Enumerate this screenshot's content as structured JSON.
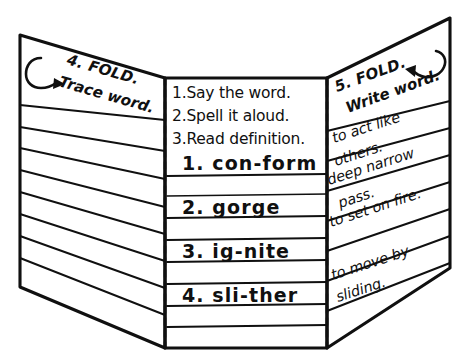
{
  "diagram": {
    "type": "hand-drawn-trifold",
    "ink_color": "#101010",
    "paper_color": "#ffffff",
    "panels": [
      {
        "id": "left",
        "name": "trace-panel",
        "heading_number": "4. FOLD.",
        "heading_text": "Trace word.",
        "arrow_icon": "curved-arrow-right",
        "ruled_line_count": 9,
        "entries": []
      },
      {
        "id": "middle",
        "name": "steps-and-words-panel",
        "steps": [
          "1.Say the word.",
          "2.Spell it aloud.",
          "3.Read definition."
        ],
        "words": [
          "1. con-form",
          "2. gorge",
          "3. ig-nite",
          "4. sli-ther"
        ],
        "ruled_line_count": 10
      },
      {
        "id": "right",
        "name": "write-and-define-panel",
        "heading_number": "5. FOLD.",
        "heading_text": "Write word.",
        "arrow_icon": "curved-arrow-left",
        "definitions": [
          {
            "line1": "to act like",
            "line2": "others."
          },
          {
            "line1": "deep narrow",
            "line2": "pass."
          },
          {
            "line1": "to set on fire.",
            "line2": ""
          },
          {
            "line1": "to move by",
            "line2": "sliding."
          }
        ],
        "ruled_line_count": 8
      }
    ],
    "fold_lines": [
      {
        "name": "left-fold-crease",
        "style": "dashed"
      },
      {
        "name": "right-fold-crease",
        "style": "dashed"
      }
    ]
  }
}
